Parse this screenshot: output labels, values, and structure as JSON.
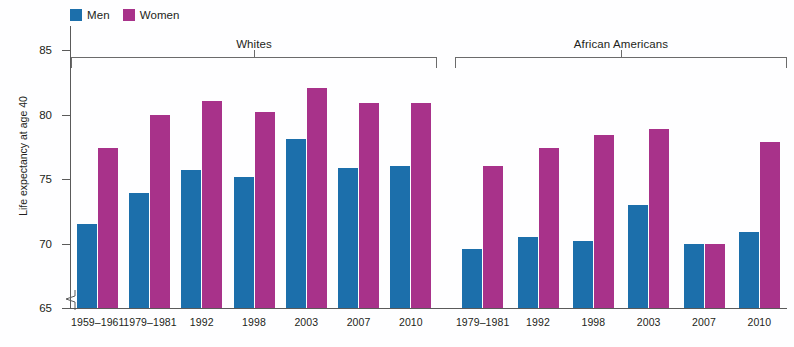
{
  "chart_data": {
    "type": "bar",
    "title": "",
    "xlabel": "",
    "ylabel": "Life expectancy at age 40",
    "ylim": [
      65,
      86.5
    ],
    "y_ticks": [
      65,
      70,
      75,
      80,
      85
    ],
    "y_axis_broken": true,
    "grid": false,
    "legend_position": "top-left",
    "legend": [
      {
        "name": "Men",
        "color": "#1c6fab"
      },
      {
        "name": "Women",
        "color": "#a8328a"
      }
    ],
    "groups": [
      {
        "label": "Whites",
        "categories": [
          "1959–1961",
          "1979–1981",
          "1992",
          "1998",
          "2003",
          "2007",
          "2010"
        ],
        "series": [
          {
            "name": "Men",
            "values": [
              71.5,
              73.9,
              75.7,
              75.2,
              78.1,
              75.9,
              76.0
            ]
          },
          {
            "name": "Women",
            "values": [
              77.4,
              80.0,
              81.1,
              80.2,
              82.1,
              80.9,
              80.9
            ]
          }
        ]
      },
      {
        "label": "African Americans",
        "categories": [
          "1979–1981",
          "1992",
          "1998",
          "2003",
          "2007",
          "2010"
        ],
        "series": [
          {
            "name": "Men",
            "values": [
              69.6,
              70.5,
              70.2,
              73.0,
              70.0,
              70.9
            ]
          },
          {
            "name": "Women",
            "values": [
              76.0,
              77.4,
              78.4,
              78.9,
              70.0,
              77.9
            ]
          }
        ]
      }
    ]
  },
  "colors": {
    "men": "#1c6fab",
    "women": "#a8328a",
    "axis": "#5a5a5a",
    "bracket": "#6b6b6b",
    "text": "#231f20",
    "background": "#fefeff"
  }
}
